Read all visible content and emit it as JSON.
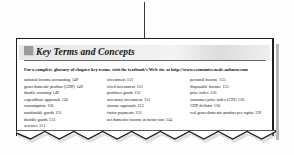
{
  "box": {
    "title": "Key Terms and Concepts",
    "badge_icon": "square-bullet-icon",
    "glossary_note_prefix": "For a complete glossary of chapter key terms, visit the textbook's Web site at ",
    "glossary_note_url": "http://www.economics.ncde.auburn.com",
    "columns": [
      {
        "items": [
          {
            "term": "national income accounting",
            "page": "149"
          },
          {
            "term": "gross domestic product (GDP)",
            "page": "149"
          },
          {
            "term": "double counting",
            "page": "149"
          },
          {
            "term": "expenditure approach",
            "page": "150"
          },
          {
            "term": "consumption",
            "page": "150"
          },
          {
            "term": "nondurable goods",
            "page": "151"
          },
          {
            "term": "durable goods",
            "page": "151"
          },
          {
            "term": "services",
            "page": "151"
          }
        ]
      },
      {
        "items": [
          {
            "term": "investment",
            "page": "151"
          },
          {
            "term": "fixed investment",
            "page": "151"
          },
          {
            "term": "producer goods",
            "page": "151"
          },
          {
            "term": "inventory investment",
            "page": "151"
          },
          {
            "term": "income approach",
            "page": "153"
          },
          {
            "term": "factor payments",
            "page": "153"
          },
          {
            "term": "net domestic income at factor cost",
            "page": "154"
          }
        ]
      },
      {
        "items": [
          {
            "term": "personal income",
            "page": "155"
          },
          {
            "term": "disposable income",
            "page": "155"
          },
          {
            "term": "price index",
            "page": "156"
          },
          {
            "term": "consumer price index (CPI)",
            "page": "156"
          },
          {
            "term": "GDP deflator",
            "page": "156"
          },
          {
            "term": "real gross domestic product per capita",
            "page": "159"
          }
        ]
      }
    ]
  },
  "annotation": {
    "leader_line": "callout-leader-line"
  },
  "colors": {
    "border": "#1e1e1e",
    "title_band_light": "#f3f3f3",
    "title_band_dark": "#dcdcdc",
    "text": "#1a1a1a",
    "badge": "#9a9a9a"
  }
}
